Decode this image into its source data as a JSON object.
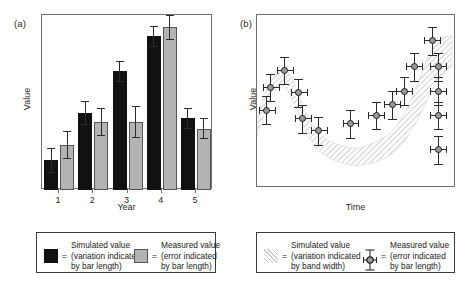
{
  "figure": {
    "panels": [
      {
        "tag": "(a)",
        "ylabel": "Value",
        "xlabel": "Year",
        "xticks": [
          "1",
          "2",
          "3",
          "4",
          "5"
        ]
      },
      {
        "tag": "(b)",
        "ylabel": "Value",
        "xlabel": "Time",
        "xticks": []
      }
    ]
  },
  "legend_a": {
    "simulated": {
      "title": "Simulated value",
      "eq": "=",
      "line1": "(variation indicated",
      "line2": "by bar length)",
      "swatch": "black-square-icon",
      "color": "#111111"
    },
    "measured": {
      "title": "Measured value",
      "eq": "=",
      "line1": "(error indicated",
      "line2": "by bar length)",
      "swatch": "grey-square-icon",
      "color": "#b3b3b3"
    }
  },
  "legend_b": {
    "simulated": {
      "title": "Simulated value",
      "eq": "=",
      "line1": "(variation indicated",
      "line2": "by band width)",
      "swatch": "hatched-band-icon",
      "color": "#cccccc"
    },
    "measured": {
      "title": "Measured value",
      "eq": "=",
      "line1": "(error indicated",
      "line2": "by bar length)",
      "swatch": "point-errorbar-icon",
      "color": "#9a9a9a"
    }
  },
  "chart_data": [
    {
      "type": "bar",
      "panel": "(a)",
      "title": "",
      "xlabel": "Year",
      "ylabel": "Value",
      "categories": [
        "1",
        "2",
        "3",
        "4",
        "5"
      ],
      "ylim": [
        0,
        100
      ],
      "grid": false,
      "legend_position": "below",
      "series": [
        {
          "name": "Simulated value",
          "color": "#111111",
          "values": [
            17,
            44,
            68,
            88,
            41
          ],
          "errors": [
            7,
            7,
            6,
            6,
            6
          ]
        },
        {
          "name": "Measured value",
          "color": "#b3b3b3",
          "values": [
            26,
            39,
            39,
            93,
            35
          ],
          "errors": [
            8,
            8,
            9,
            7,
            6
          ]
        }
      ]
    },
    {
      "type": "scatter",
      "panel": "(b)",
      "title": "",
      "xlabel": "Time",
      "ylabel": "Value",
      "xlim": [
        0,
        100
      ],
      "ylim": [
        0,
        100
      ],
      "grid": false,
      "legend_position": "below",
      "band": {
        "name": "Simulated value",
        "color": "#cccccc",
        "x": [
          0,
          4,
          9,
          14,
          19,
          24,
          29,
          34,
          39,
          44,
          50,
          56,
          62,
          68,
          74,
          80,
          86,
          92,
          98
        ],
        "y_low": [
          30,
          44,
          56,
          58,
          48,
          34,
          24,
          19,
          16,
          14,
          13,
          14,
          16,
          20,
          27,
          38,
          52,
          64,
          70
        ],
        "y_high": [
          40,
          55,
          67,
          69,
          60,
          45,
          35,
          29,
          26,
          24,
          23,
          25,
          28,
          33,
          43,
          58,
          76,
          86,
          88
        ]
      },
      "points": [
        {
          "x": 5,
          "y": 45,
          "yerr": 8,
          "xerr": 4
        },
        {
          "x": 7,
          "y": 58,
          "yerr": 8,
          "xerr": 4
        },
        {
          "x": 14,
          "y": 68,
          "yerr": 8,
          "xerr": 4
        },
        {
          "x": 21,
          "y": 55,
          "yerr": 8,
          "xerr": 4
        },
        {
          "x": 23,
          "y": 40,
          "yerr": 8,
          "xerr": 4
        },
        {
          "x": 31,
          "y": 33,
          "yerr": 8,
          "xerr": 4
        },
        {
          "x": 47,
          "y": 37,
          "yerr": 8,
          "xerr": 4
        },
        {
          "x": 60,
          "y": 42,
          "yerr": 8,
          "xerr": 4
        },
        {
          "x": 68,
          "y": 48,
          "yerr": 8,
          "xerr": 4
        },
        {
          "x": 74,
          "y": 56,
          "yerr": 8,
          "xerr": 4
        },
        {
          "x": 79,
          "y": 70,
          "yerr": 8,
          "xerr": 4
        },
        {
          "x": 88,
          "y": 85,
          "yerr": 8,
          "xerr": 4
        },
        {
          "x": 91,
          "y": 70,
          "yerr": 8,
          "xerr": 4
        },
        {
          "x": 91,
          "y": 56,
          "yerr": 8,
          "xerr": 4
        },
        {
          "x": 91,
          "y": 42,
          "yerr": 8,
          "xerr": 4
        },
        {
          "x": 91,
          "y": 22,
          "yerr": 8,
          "xerr": 4
        }
      ]
    }
  ]
}
